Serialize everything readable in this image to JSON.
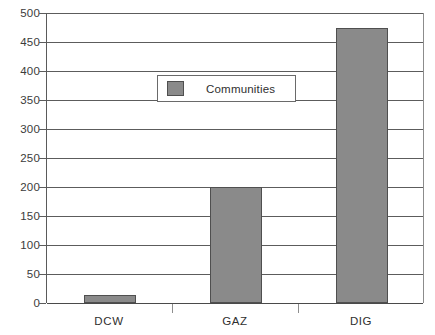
{
  "chart_data": {
    "type": "bar",
    "title": "",
    "subtitle": "",
    "xlabel": "",
    "ylabel": "",
    "categories": [
      "DCW",
      "GAZ",
      "DIG"
    ],
    "series": [
      {
        "name": "Communities",
        "values": [
          14,
          200,
          475
        ],
        "color": "#8a8a8a"
      }
    ],
    "ylim": [
      0,
      500
    ],
    "y_ticks": [
      0,
      50,
      100,
      150,
      200,
      250,
      300,
      350,
      400,
      450,
      500
    ],
    "y_tick_labels": [
      "0",
      "50",
      "100",
      "150",
      "200",
      "250",
      "300",
      "350",
      "400",
      "450",
      "500"
    ],
    "grid": true,
    "grid_axis": "y",
    "legend": {
      "position": "inside-upper-left",
      "entries": [
        "Communities"
      ]
    },
    "colors": {
      "bar_fill": "#8a8a8a",
      "bar_border": "#4f4f4f",
      "gridline": "#5c5c5c",
      "axis": "#5a5a5a",
      "background": "#ffffff",
      "text": "#2f2f2f"
    }
  }
}
